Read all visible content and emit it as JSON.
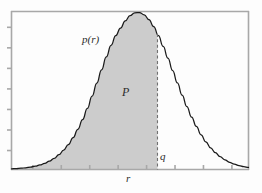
{
  "figure": {
    "type": "probability-density-plot",
    "background_color": "#fdfdfd",
    "frame_color": "#a8a8a8",
    "curve_color": "#1a1a1a",
    "fill_color": "#cccccc",
    "dash_color": "#777777"
  },
  "labels": {
    "density_label": "p(r)",
    "area_label": "P",
    "quantile_label": "q",
    "xaxis_label": "r"
  },
  "chart_data": {
    "type": "area",
    "title": "",
    "xlabel": "r",
    "ylabel": "p(r)",
    "grid": false,
    "legend": "none",
    "xlim": [
      0,
      1
    ],
    "ylim": [
      0,
      1
    ],
    "annotations": [
      {
        "text": "p(r)",
        "x": 0.3,
        "y": 0.72,
        "role": "curve-label"
      },
      {
        "text": "P",
        "x": 0.48,
        "y": 0.44,
        "role": "shaded-area-label"
      },
      {
        "text": "q",
        "x": 0.63,
        "y": 0.07,
        "role": "quantile-marker-label"
      },
      {
        "text": "r",
        "x": 0.5,
        "y": -0.09,
        "role": "x-axis-label"
      }
    ],
    "shaded_region": {
      "from": 0.0,
      "to": 0.616,
      "label": "P"
    },
    "quantile_line": {
      "x": 0.616,
      "style": "dashed",
      "label": "q"
    },
    "x_ticks": [
      0.09,
      0.21,
      0.33,
      0.45,
      0.57,
      0.69,
      0.81,
      0.93
    ],
    "x_tick_labels": [
      "",
      "",
      "",
      "",
      "",
      "",
      "",
      ""
    ],
    "y_ticks": [
      0.12,
      0.25,
      0.38,
      0.51,
      0.64,
      0.77,
      0.9
    ],
    "y_tick_labels": [
      "",
      "",
      "",
      "",
      "",
      "",
      ""
    ],
    "x": [
      0.0,
      0.02,
      0.04,
      0.06,
      0.08,
      0.1,
      0.12,
      0.14,
      0.16,
      0.18,
      0.2,
      0.22,
      0.24,
      0.26,
      0.28,
      0.3,
      0.32,
      0.34,
      0.36,
      0.38,
      0.4,
      0.42,
      0.44,
      0.46,
      0.48,
      0.5,
      0.52,
      0.54,
      0.56,
      0.58,
      0.6,
      0.62,
      0.64,
      0.66,
      0.68,
      0.7,
      0.72,
      0.74,
      0.76,
      0.78,
      0.8,
      0.82,
      0.84,
      0.86,
      0.88,
      0.9,
      0.92,
      0.94,
      0.96,
      0.98,
      1.0
    ],
    "values": [
      0.004,
      0.006,
      0.008,
      0.011,
      0.015,
      0.021,
      0.029,
      0.039,
      0.053,
      0.071,
      0.094,
      0.123,
      0.159,
      0.203,
      0.256,
      0.318,
      0.389,
      0.467,
      0.55,
      0.635,
      0.717,
      0.791,
      0.853,
      0.901,
      0.946,
      0.98,
      0.998,
      1.0,
      0.985,
      0.955,
      0.91,
      0.852,
      0.784,
      0.709,
      0.63,
      0.551,
      0.474,
      0.401,
      0.334,
      0.274,
      0.221,
      0.176,
      0.138,
      0.107,
      0.082,
      0.062,
      0.046,
      0.034,
      0.025,
      0.018,
      0.013
    ]
  }
}
